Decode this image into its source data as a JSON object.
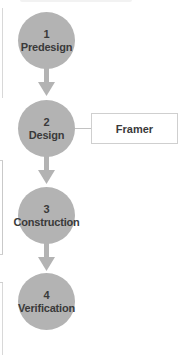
{
  "diagram": {
    "type": "vertical-process-flow",
    "colors": {
      "step_fill": "#b3b3b3",
      "step_text": "#3a3a3a",
      "arrow": "#b3b3b3",
      "box_border": "#cfcfcf",
      "connector": "#c2c2c2"
    },
    "steps": [
      {
        "number": "1",
        "label": "Predesign"
      },
      {
        "number": "2",
        "label": "Design"
      },
      {
        "number": "3",
        "label": "Construction"
      },
      {
        "number": "4",
        "label": "Verification"
      }
    ],
    "side_box": {
      "attached_to_step": "2",
      "label": "Framer"
    },
    "arrows": [
      {
        "from": "1",
        "to": "2"
      },
      {
        "from": "2",
        "to": "3"
      },
      {
        "from": "3",
        "to": "4"
      }
    ]
  }
}
